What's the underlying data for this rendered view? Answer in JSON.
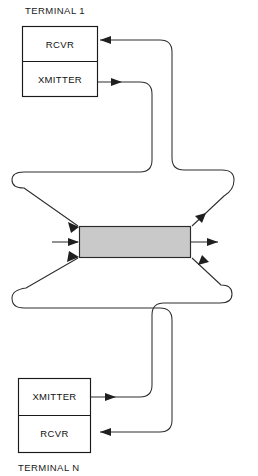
{
  "figure": {
    "type": "block-diagram",
    "topology": "star-network-hub",
    "width": 258,
    "height": 476,
    "background_color": "#ffffff",
    "line_color": "#2e2e2e"
  },
  "terminals": [
    {
      "id": "terminal-1",
      "label": "TERMINAL 1",
      "label_position": "above",
      "units": [
        {
          "id": "rcvr-top",
          "label": "RCVR"
        },
        {
          "id": "xmitter-top",
          "label": "XMITTER"
        }
      ]
    },
    {
      "id": "terminal-n",
      "label": "TERMINAL N",
      "label_position": "below",
      "units": [
        {
          "id": "xmitter-bottom",
          "label": "XMITTER"
        },
        {
          "id": "rcvr-bottom",
          "label": "RCVR"
        }
      ]
    }
  ],
  "hub": {
    "id": "central-hub",
    "label": "",
    "fill_color": "#c9c9c9",
    "stroke_color": "#2a2a2a",
    "inputs": 3,
    "outputs": 3
  },
  "connections": [
    {
      "id": "xmitter-1-to-hub",
      "from": "xmitter-top",
      "to": "central-hub",
      "direction": "into-hub"
    },
    {
      "id": "hub-to-rcvr-1",
      "from": "central-hub",
      "to": "rcvr-top",
      "direction": "out-of-hub"
    },
    {
      "id": "xmitter-n-to-hub",
      "from": "xmitter-bottom",
      "to": "central-hub",
      "direction": "into-hub"
    },
    {
      "id": "hub-to-rcvr-n",
      "from": "central-hub",
      "to": "rcvr-bottom",
      "direction": "out-of-hub"
    },
    {
      "id": "hub-input-stub-left",
      "from": "external",
      "to": "central-hub",
      "direction": "into-hub"
    },
    {
      "id": "hub-output-stub-right",
      "from": "central-hub",
      "to": "external",
      "direction": "out-of-hub"
    }
  ]
}
